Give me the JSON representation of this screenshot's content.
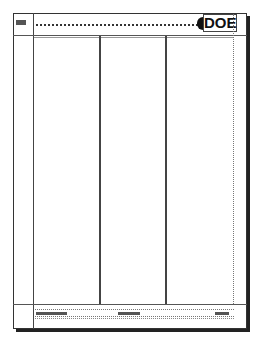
{
  "page": {
    "type": "newspaper-layout-template",
    "masthead": {
      "text": "DOE"
    },
    "header": {
      "logo_placeholder": "logo-box",
      "rule_style": "dotted"
    },
    "columns": {
      "count": 3
    },
    "footer": {
      "placeholders": [
        {
          "position": "left",
          "kind": "text-placeholder"
        },
        {
          "position": "center",
          "kind": "text-placeholder"
        },
        {
          "position": "right",
          "kind": "text-placeholder"
        }
      ]
    },
    "colors": {
      "ink": "#333333",
      "shadow": "#222222",
      "paper": "#ffffff"
    }
  }
}
